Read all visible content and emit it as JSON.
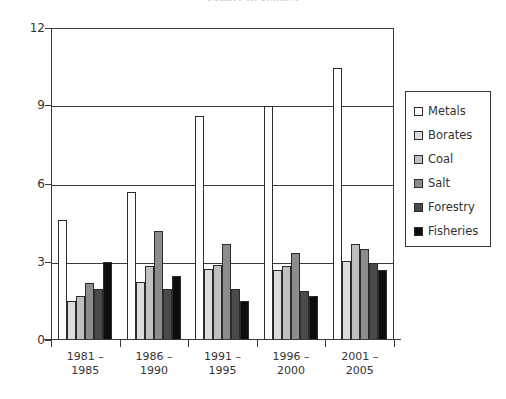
{
  "chart_data": {
    "type": "bar",
    "title": "Export Revenues",
    "xlabel": "",
    "ylabel": "",
    "ylim": [
      0,
      12
    ],
    "yticks": [
      0,
      3,
      6,
      9,
      12
    ],
    "grid": true,
    "legend_position": "right",
    "categories": [
      "1981 – 1985",
      "1986 – 1990",
      "1991 – 1995",
      "1996 – 2000",
      "2001 – 2005"
    ],
    "category_lines": [
      [
        "1981 –",
        "1985"
      ],
      [
        "1986 –",
        "1990"
      ],
      [
        "1991 –",
        "1995"
      ],
      [
        "1996 –",
        "2000"
      ],
      [
        "2001 –",
        "2005"
      ]
    ],
    "series": [
      {
        "name": "Metals",
        "color": "#ffffff",
        "values": [
          4.6,
          5.7,
          8.6,
          9.0,
          10.45
        ]
      },
      {
        "name": "Borates",
        "color": "#dcdcdc",
        "values": [
          1.5,
          2.25,
          2.75,
          2.7,
          3.05
        ]
      },
      {
        "name": "Coal",
        "color": "#c0c0c0",
        "values": [
          1.7,
          2.85,
          2.9,
          2.85,
          3.7
        ]
      },
      {
        "name": "Salt",
        "color": "#8c8c8c",
        "values": [
          2.2,
          4.2,
          3.7,
          3.35,
          3.5
        ]
      },
      {
        "name": "Forestry",
        "color": "#4a4a4a",
        "values": [
          1.95,
          1.95,
          1.95,
          1.9,
          2.95
        ]
      },
      {
        "name": "Fisheries",
        "color": "#0d0d0d",
        "values": [
          3.0,
          2.45,
          1.5,
          1.7,
          2.7
        ]
      }
    ]
  }
}
